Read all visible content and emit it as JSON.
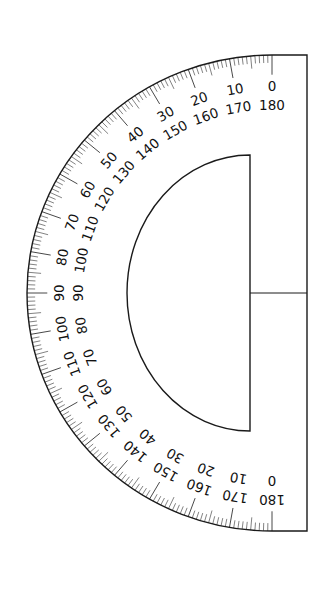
{
  "diagram": {
    "type": "semicircular protractor",
    "orientation": "vertical, straight edge on right",
    "colors": {
      "background": "#ffffff",
      "line": "#1a1a1a",
      "text": "#111111"
    },
    "geometry": {
      "center": [
        272,
        293
      ],
      "outer_rx": 245,
      "outer_ry": 238,
      "straight_edge_x": 307,
      "inner_edge_x": 250,
      "inner_top_y": 155,
      "inner_bottom_y": 431,
      "inner_leftmost_x": 127
    },
    "scale": {
      "minor_tick_deg": 1,
      "mid_tick_deg": 5,
      "major_tick_deg": 10,
      "outer_labels": [
        "0",
        "10",
        "20",
        "30",
        "40",
        "50",
        "60",
        "70",
        "80",
        "90",
        "100",
        "110",
        "120",
        "130",
        "140",
        "150",
        "160",
        "170",
        "180"
      ],
      "inner_labels": [
        "180",
        "170",
        "160",
        "150",
        "140",
        "130",
        "120",
        "110",
        "100",
        "90",
        "80",
        "70",
        "60",
        "50",
        "40",
        "30",
        "20",
        "10",
        "0"
      ],
      "outer_label_radius": 210,
      "inner_label_radius": 191
    }
  }
}
